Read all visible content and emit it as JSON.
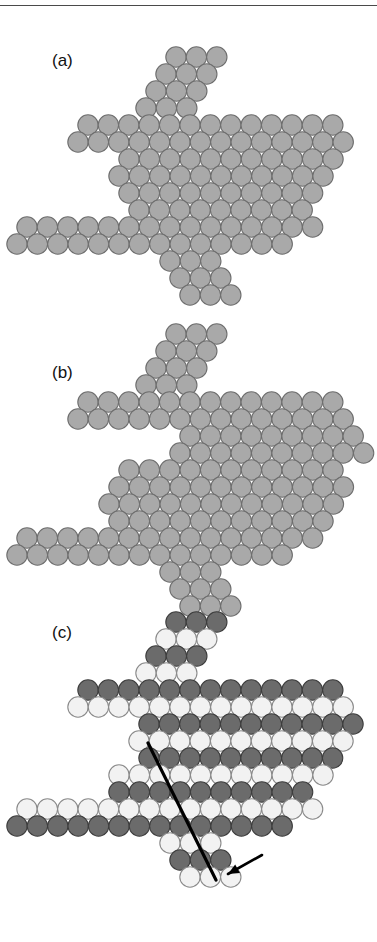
{
  "figure": {
    "has_top_rule": true,
    "background": "#ffffff",
    "width": 377,
    "height": 942
  },
  "style": {
    "radius": 10.2,
    "dx": 20.4,
    "dy": 17.4,
    "gray_fill": "#a9a9a9",
    "gray_stroke": "#6e6e6e",
    "dark_fill": "#6b6b6b",
    "dark_stroke": "#3d3d3d",
    "light_fill": "#f2f2f2",
    "light_stroke": "#8a8a8a",
    "line_color": "#000000",
    "line_width": 3.2
  },
  "panels": [
    {
      "id": "a",
      "label": "(a)",
      "label_x": 52,
      "label_y": 64,
      "origin_x": 0,
      "origin_y": 0,
      "description": "perfect close-packed cluster, uniform gray",
      "rows": [
        {
          "y": 57,
          "x0": 176,
          "n": 3,
          "color": "gray"
        },
        {
          "y": 74,
          "x0": 166,
          "n": 3,
          "color": "gray"
        },
        {
          "y": 91,
          "x0": 156,
          "n": 3,
          "color": "gray"
        },
        {
          "y": 108,
          "x0": 146,
          "n": 3,
          "color": "gray"
        },
        {
          "y": 125,
          "x0": 88,
          "n": 13,
          "color": "gray"
        },
        {
          "y": 142,
          "x0": 78,
          "n": 14,
          "color": "gray"
        },
        {
          "y": 159,
          "x0": 129,
          "n": 11,
          "color": "gray"
        },
        {
          "y": 176,
          "x0": 119,
          "n": 11,
          "color": "gray"
        },
        {
          "y": 193,
          "x0": 129,
          "n": 10,
          "color": "gray"
        },
        {
          "y": 210,
          "x0": 139,
          "n": 9,
          "color": "gray"
        },
        {
          "y": 227,
          "x0": 27,
          "n": 15,
          "color": "gray"
        },
        {
          "y": 244,
          "x0": 17,
          "n": 14,
          "color": "gray"
        },
        {
          "y": 261,
          "x0": 170,
          "n": 3,
          "color": "gray"
        },
        {
          "y": 278,
          "x0": 180,
          "n": 3,
          "color": "gray"
        },
        {
          "y": 295,
          "x0": 190,
          "n": 3,
          "color": "gray"
        }
      ]
    },
    {
      "id": "b",
      "label": "(b)",
      "label_x": 52,
      "label_y": 376,
      "origin_x": 0,
      "origin_y": 0,
      "description": "same cluster after slip: upper half displaced, gap along slip plane",
      "rows": [
        {
          "y": 334,
          "x0": 176,
          "n": 3,
          "color": "gray"
        },
        {
          "y": 351,
          "x0": 166,
          "n": 3,
          "color": "gray"
        },
        {
          "y": 368,
          "x0": 156,
          "n": 3,
          "color": "gray"
        },
        {
          "y": 385,
          "x0": 146,
          "n": 3,
          "color": "gray"
        },
        {
          "y": 402,
          "x0": 88,
          "n": 13,
          "color": "gray"
        },
        {
          "y": 419,
          "x0": 78,
          "n": 14,
          "color": "gray"
        },
        {
          "y": 436,
          "x0": 190,
          "n": 9,
          "color": "gray"
        },
        {
          "y": 453,
          "x0": 180,
          "n": 10,
          "color": "gray"
        },
        {
          "y": 470,
          "x0": 129,
          "n": 11,
          "color": "gray"
        },
        {
          "y": 487,
          "x0": 119,
          "n": 12,
          "color": "gray"
        },
        {
          "y": 504,
          "x0": 109,
          "n": 12,
          "color": "gray"
        },
        {
          "y": 521,
          "x0": 119,
          "n": 11,
          "color": "gray"
        },
        {
          "y": 538,
          "x0": 27,
          "n": 15,
          "color": "gray"
        },
        {
          "y": 555,
          "x0": 17,
          "n": 14,
          "color": "gray"
        },
        {
          "y": 572,
          "x0": 170,
          "n": 3,
          "color": "gray"
        },
        {
          "y": 589,
          "x0": 180,
          "n": 3,
          "color": "gray"
        },
        {
          "y": 606,
          "x0": 190,
          "n": 3,
          "color": "gray"
        }
      ]
    },
    {
      "id": "c",
      "label": "(c)",
      "label_x": 52,
      "label_y": 636,
      "origin_x": 0,
      "origin_y": 0,
      "description": "two-colour sublattice view with slip plane line and arrow marking the dislocation",
      "rows": [
        {
          "y": 622,
          "x0": 176,
          "n": 3,
          "color": "dark"
        },
        {
          "y": 639,
          "x0": 166,
          "n": 3,
          "color": "light"
        },
        {
          "y": 656,
          "x0": 156,
          "n": 3,
          "color": "dark"
        },
        {
          "y": 673,
          "x0": 146,
          "n": 3,
          "color": "light"
        },
        {
          "y": 690,
          "x0": 88,
          "n": 13,
          "color": "dark"
        },
        {
          "y": 707,
          "x0": 78,
          "n": 14,
          "color": "light"
        },
        {
          "y": 724,
          "x0": 149,
          "n": 11,
          "color": "dark"
        },
        {
          "y": 741,
          "x0": 139,
          "n": 11,
          "color": "light"
        },
        {
          "y": 758,
          "x0": 149,
          "n": 10,
          "color": "dark"
        },
        {
          "y": 775,
          "x0": 119,
          "n": 11,
          "color": "light"
        },
        {
          "y": 792,
          "x0": 119,
          "n": 10,
          "color": "dark"
        },
        {
          "y": 809,
          "x0": 27,
          "n": 15,
          "color": "light"
        },
        {
          "y": 826,
          "x0": 17,
          "n": 14,
          "color": "dark"
        },
        {
          "y": 843,
          "x0": 170,
          "n": 3,
          "color": "light"
        },
        {
          "y": 860,
          "x0": 180,
          "n": 3,
          "color": "dark"
        },
        {
          "y": 877,
          "x0": 190,
          "n": 3,
          "color": "light"
        }
      ],
      "annotations": {
        "slip_line": {
          "x1": 148,
          "y1": 743,
          "x2": 216,
          "y2": 880
        },
        "arrow": {
          "tip_x": 228,
          "tip_y": 874,
          "tail_x": 262,
          "tail_y": 855
        }
      }
    }
  ]
}
